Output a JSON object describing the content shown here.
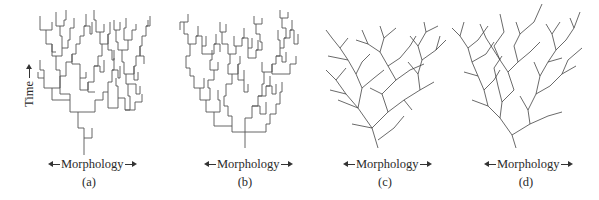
{
  "figure": {
    "y_axis_label": "Time",
    "panels": [
      {
        "id": "a",
        "label": "(a)",
        "x_axis_label": "Morphology",
        "style": "rectangular-branching"
      },
      {
        "id": "b",
        "label": "(b)",
        "x_axis_label": "Morphology",
        "style": "rectangular-branching"
      },
      {
        "id": "c",
        "label": "(c)",
        "x_axis_label": "Morphology",
        "style": "diagonal-branching"
      },
      {
        "id": "d",
        "label": "(d)",
        "x_axis_label": "Morphology",
        "style": "diagonal-branching"
      }
    ]
  },
  "colors": {
    "line": "#555555",
    "text": "#2a2a2a",
    "background": "#ffffff"
  }
}
